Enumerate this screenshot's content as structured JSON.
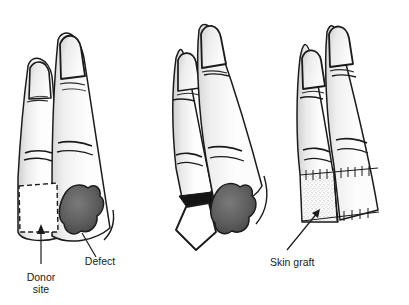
{
  "figure": {
    "background_color": "#ffffff",
    "width": 409,
    "height": 305,
    "ink_color": "#1b1b1b",
    "skin_fill": "#fdfdfd",
    "shade_color": "#d8d8d8",
    "defect_color": "#5a5a5a",
    "flap_shadow_color": "#141414"
  },
  "panels": [
    {
      "id": "panel-1",
      "name": "donor-site-and-defect-panel",
      "caption": "Fingers with marked donor site and soft-tissue defect",
      "annotations": [
        {
          "id": "donor-site",
          "label_line_1": "Donor",
          "label_line_2": "site",
          "marker": "dashed-rectangle",
          "leader": "arrow-up"
        },
        {
          "id": "defect",
          "label_line_1": "Defect",
          "label_line_2": "",
          "marker": "dark-irregular-blob",
          "leader": "line"
        }
      ]
    },
    {
      "id": "panel-2",
      "name": "flap-elevation-panel",
      "caption": "Flap raised from the donor finger toward the defect",
      "annotations": []
    },
    {
      "id": "panel-3",
      "name": "skin-graft-panel",
      "caption": "Donor site resurfaced with a skin graft",
      "annotations": [
        {
          "id": "skin-graft",
          "label_line_1": "Skin graft",
          "label_line_2": "",
          "marker": "stippled-area",
          "leader": "line"
        }
      ]
    }
  ],
  "labels": {
    "donor_site_1": "Donor",
    "donor_site_2": "site",
    "defect": "Defect",
    "skin_graft": "Skin graft"
  }
}
